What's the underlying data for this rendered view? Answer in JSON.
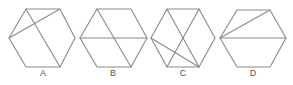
{
  "figure": {
    "stroke_color": "#8a8a8a",
    "label_color": "#555555",
    "options": [
      {
        "label": "A",
        "label_x": 43,
        "hexagon": [
          [
            26,
            9
          ],
          [
            60,
            9
          ],
          [
            75,
            38
          ],
          [
            60,
            67
          ],
          [
            26,
            67
          ],
          [
            9,
            38
          ]
        ],
        "lines": [
          [
            [
              26,
              9
            ],
            [
              60,
              67
            ]
          ],
          [
            [
              9,
              38
            ],
            [
              60,
              9
            ]
          ]
        ]
      },
      {
        "label": "B",
        "label_x": 113,
        "hexagon": [
          [
            97,
            9
          ],
          [
            131,
            9
          ],
          [
            147,
            38
          ],
          [
            131,
            67
          ],
          [
            97,
            67
          ],
          [
            80,
            38
          ]
        ],
        "lines": [
          [
            [
              80,
              38
            ],
            [
              147,
              38
            ]
          ],
          [
            [
              97,
              9
            ],
            [
              131,
              67
            ]
          ]
        ]
      },
      {
        "label": "C",
        "label_x": 183,
        "hexagon": [
          [
            167,
            9
          ],
          [
            199,
            9
          ],
          [
            215,
            38
          ],
          [
            199,
            67
          ],
          [
            167,
            67
          ],
          [
            151,
            38
          ]
        ],
        "lines": [
          [
            [
              167,
              9
            ],
            [
              199,
              67
            ]
          ],
          [
            [
              199,
              9
            ],
            [
              167,
              67
            ]
          ],
          [
            [
              151,
              38
            ],
            [
              199,
              67
            ]
          ]
        ]
      },
      {
        "label": "D",
        "label_x": 253,
        "hexagon": [
          [
            237,
            10
          ],
          [
            270,
            10
          ],
          [
            286,
            38
          ],
          [
            270,
            67
          ],
          [
            237,
            67
          ],
          [
            220,
            38
          ]
        ],
        "lines": [
          [
            [
              220,
              38
            ],
            [
              270,
              10
            ]
          ],
          [
            [
              220,
              38
            ],
            [
              286,
              38
            ]
          ]
        ]
      }
    ]
  }
}
